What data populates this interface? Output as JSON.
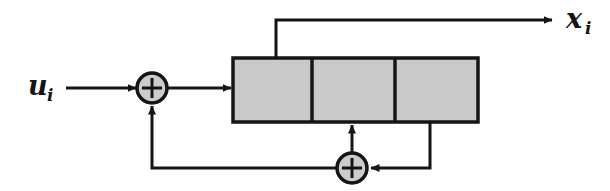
{
  "figure": {
    "type": "signal-flow-block-diagram"
  },
  "labels": {
    "input": {
      "symbol": "u",
      "subscript": "i",
      "full": "u_i"
    },
    "output": {
      "symbol": "x",
      "subscript": "i",
      "full": "x_i"
    }
  },
  "nodes": {
    "sum_top": {
      "name": "summing-junction-top",
      "operator": "+",
      "cx": 152,
      "cy": 88,
      "r": 15
    },
    "sum_bottom": {
      "name": "summing-junction-bottom",
      "operator": "+",
      "cx": 352,
      "cy": 168,
      "r": 15
    },
    "block": {
      "name": "delay-block",
      "x": 233,
      "y": 58,
      "width": 245,
      "height": 64,
      "sections": 3,
      "divider_x": [
        312,
        395
      ]
    }
  },
  "colors": {
    "stroke": "#151515",
    "block_fill": "#c9c9c9",
    "junction_fill": "#cccccc",
    "background": "#ffffff"
  },
  "connections": [
    {
      "name": "input-to-sum-top",
      "from": "u_i",
      "to": "summing-junction-top",
      "arrow": true
    },
    {
      "name": "sum-top-to-block",
      "from": "summing-junction-top",
      "to": "delay-block",
      "arrow": true
    },
    {
      "name": "block-tap-to-output",
      "from": "delay-block",
      "to": "x_i",
      "arrow": true
    },
    {
      "name": "block-to-sum-bottom",
      "from": "delay-block",
      "to": "summing-junction-bottom",
      "arrow": true
    },
    {
      "name": "sum-bottom-to-block",
      "from": "summing-junction-bottom",
      "to": "delay-block",
      "arrow": true
    },
    {
      "name": "sum-bottom-to-sum-top-feedback",
      "from": "summing-junction-bottom",
      "to": "summing-junction-top",
      "arrow": true
    }
  ]
}
